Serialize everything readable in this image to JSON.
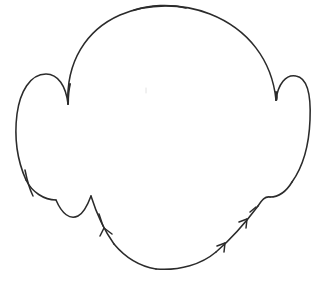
{
  "document": {
    "title": "Head Outline Sketch",
    "type": "line-drawing",
    "medium": "hand-drawn pen contour",
    "subject": "frontal view of a bald human head with prominent protruding ears",
    "background_color": "#ffffff",
    "ink_color": "#2b2b2b",
    "faint_mark_color": "#e2e2e2",
    "canvas": {
      "width": 324,
      "height": 287
    }
  },
  "drawing": {
    "stroke_width_main": 1.55,
    "stroke_width_accent": 2.0,
    "bounding_box": {
      "left": 15,
      "top": 4,
      "right": 311,
      "bottom": 272
    },
    "parts": [
      {
        "name": "cranium-dome",
        "description": "large rounded skull arc across the top"
      },
      {
        "name": "left-ear",
        "description": "protruding ear on the viewer's left"
      },
      {
        "name": "right-ear",
        "description": "protruding ear on the viewer's right"
      },
      {
        "name": "left-jaw",
        "description": "lower-left jaw contour with a bump"
      },
      {
        "name": "chin",
        "description": "flattened lower chin curve"
      },
      {
        "name": "right-jaw",
        "description": "diagonal lower-right jaw line with barbs"
      },
      {
        "name": "center-dot",
        "description": "very faint light grey speck near the center of the face"
      }
    ],
    "paths": {
      "cranium": "M 68 104 C 66 62 86 30 120 15 C 148 3 182 3 210 14 C 248 29 272 60 276 100",
      "left_ear_outer": "M 68 104 C 66 86 58 74 46 74 C 30 74 20 92 17 114 C 14 138 18 162 26 180",
      "left_ear_lower": "M 26 180 C 32 192 44 200 56 200",
      "left_ear_tip_spur": "M 25 170 C 27 180 29 188 33 196",
      "right_ear_outer": "M 276 100 C 278 84 286 74 296 76 C 308 78 311 98 310 120 C 309 146 302 168 292 182",
      "right_ear_lower": "M 292 182 C 286 192 278 197 270 197",
      "left_jaw": "M 56 200 C 62 214 70 220 78 216 C 84 213 88 204 91 196",
      "left_jaw_to_chin": "M 91 196 C 96 212 104 230 114 244",
      "chin_left": "M 114 244 C 124 256 138 266 156 269",
      "chin_right": "M 156 269 C 180 271 202 264 216 252",
      "right_jaw_lower": "M 216 252 C 230 240 246 222 258 206",
      "right_jaw_upper": "M 258 206 C 262 200 265 196 270 197",
      "barb_left_jaw_a": "M 104 228 L 112 234",
      "barb_left_jaw_b": "M 104 228 L 100 236",
      "barb_left_jaw_c": "M 99 214 L 103 226",
      "barb_right_jaw_a": "M 225 243 L 217 246",
      "barb_right_jaw_b": "M 225 243 L 224 252",
      "barb_right_jaw_c": "M 247 219 L 239 222",
      "barb_right_jaw_d": "M 247 219 L 246 228",
      "barb_right_jaw_e": "M 256 207 L 250 212",
      "crown_accent": "M 134 10 C 150 5 170 4 186 8",
      "left_temple_accent": "M 70 84 C 68 92 68 98 68 104",
      "right_temple_accent": "M 276 92 C 277 96 277 100 276 100",
      "center_faint_dot": "M 146 88 L 146 93"
    }
  }
}
